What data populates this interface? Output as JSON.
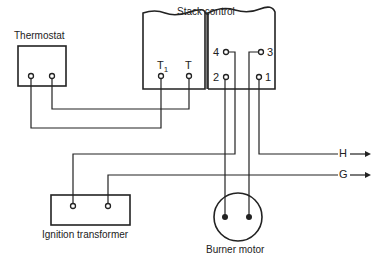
{
  "diagram": {
    "components": {
      "thermostat": {
        "label": "Thermostat"
      },
      "stack_control": {
        "label": "Stack control",
        "terminals": {
          "t1": "T",
          "t1_sub": "1",
          "t": "T",
          "t4": "4",
          "t3": "3",
          "t2": "2",
          "t_one": "1"
        }
      },
      "ignition_transformer": {
        "label": "Ignition transformer"
      },
      "burner_motor": {
        "label": "Burner motor"
      }
    },
    "outputs": {
      "h": "H",
      "g": "G"
    },
    "colors": {
      "line": "#222222",
      "background": "#ffffff"
    }
  }
}
